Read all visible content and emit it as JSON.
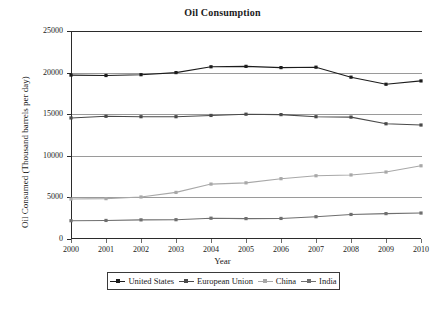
{
  "chart_data": {
    "type": "line",
    "title": "Oil Consumption",
    "xlabel": "Year",
    "ylabel": "Oil Consumed (Thousand barrels per day)",
    "categories": [
      "2000",
      "2001",
      "2002",
      "2003",
      "2004",
      "2005",
      "2006",
      "2007",
      "2008",
      "2009",
      "2010"
    ],
    "x": [
      2000,
      2001,
      2002,
      2003,
      2004,
      2005,
      2006,
      2007,
      2008,
      2009,
      2010
    ],
    "ylim": [
      0,
      25000
    ],
    "yticks": [
      0,
      5000,
      10000,
      15000,
      20000,
      25000
    ],
    "ytick_labels": [
      "0",
      "5000",
      "10000",
      "15000",
      "20000",
      "25000"
    ],
    "grid": true,
    "legend_position": "bottom",
    "series": [
      {
        "name": "United States",
        "color": "#1c1c1c",
        "marker": "square",
        "values": [
          19700,
          19650,
          19750,
          20000,
          20700,
          20750,
          20600,
          20650,
          19450,
          18600,
          19000
        ]
      },
      {
        "name": "European Union",
        "color": "#4a4a4a",
        "marker": "square",
        "values": [
          14550,
          14750,
          14700,
          14700,
          14850,
          15000,
          14950,
          14700,
          14650,
          13850,
          13700
        ]
      },
      {
        "name": "China",
        "color": "#a8a8a8",
        "marker": "square",
        "values": [
          4800,
          4850,
          5050,
          5600,
          6600,
          6750,
          7250,
          7600,
          7700,
          8050,
          8800
        ]
      },
      {
        "name": "India",
        "color": "#6f6f6f",
        "marker": "square",
        "values": [
          2200,
          2230,
          2300,
          2320,
          2500,
          2450,
          2470,
          2680,
          2950,
          3050,
          3120
        ]
      }
    ]
  }
}
